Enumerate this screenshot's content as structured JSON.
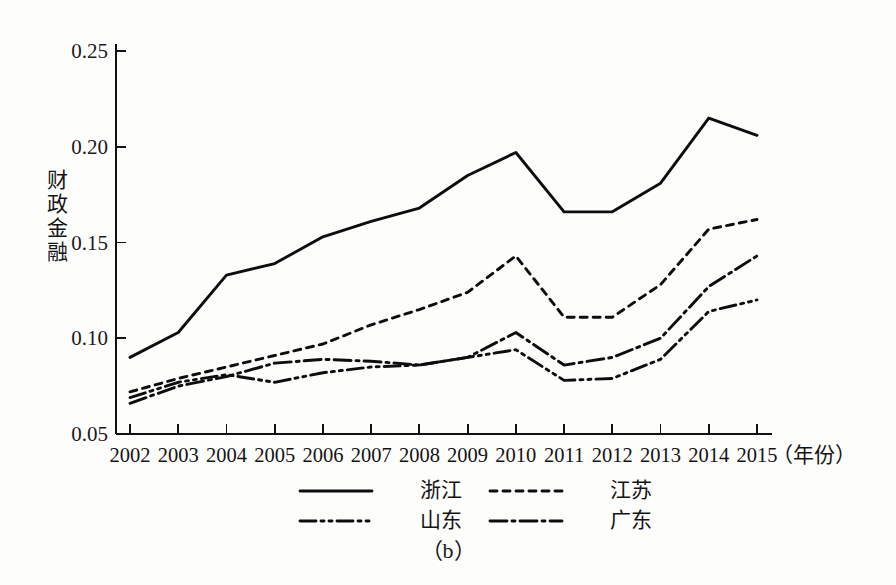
{
  "figure": {
    "caption": "（b）",
    "ylabel_chars": [
      "财",
      "政",
      "金",
      "融"
    ],
    "xlabel_suffix": "（年份）"
  },
  "chart_data": {
    "type": "line",
    "title": "",
    "xlabel": "（年份）",
    "ylabel": "财政金融",
    "categories": [
      "2002",
      "2003",
      "2004",
      "2005",
      "2006",
      "2007",
      "2008",
      "2009",
      "2010",
      "2011",
      "2012",
      "2013",
      "2014",
      "2015"
    ],
    "ylim": [
      0.05,
      0.25
    ],
    "yticks": [
      "0.05",
      "0.10",
      "0.15",
      "0.20",
      "0.25"
    ],
    "ytick_values": [
      0.05,
      0.1,
      0.15,
      0.2,
      0.25
    ],
    "grid": false,
    "legend_position": "bottom",
    "series": [
      {
        "name": "浙江",
        "style": "solid",
        "values": [
          0.09,
          0.103,
          0.133,
          0.139,
          0.153,
          0.161,
          0.168,
          0.185,
          0.197,
          0.166,
          0.166,
          0.181,
          0.215,
          0.206
        ]
      },
      {
        "name": "江苏",
        "style": "dotted",
        "values": [
          0.072,
          0.079,
          0.085,
          0.091,
          0.097,
          0.107,
          0.115,
          0.124,
          0.143,
          0.111,
          0.111,
          0.128,
          0.157,
          0.162
        ]
      },
      {
        "name": "山东",
        "style": "dash-dot-dot",
        "values": [
          0.069,
          0.077,
          0.081,
          0.077,
          0.082,
          0.085,
          0.086,
          0.09,
          0.094,
          0.078,
          0.079,
          0.089,
          0.114,
          0.12
        ]
      },
      {
        "name": "广东",
        "style": "dash-dot",
        "values": [
          0.066,
          0.075,
          0.08,
          0.087,
          0.089,
          0.088,
          0.086,
          0.09,
          0.103,
          0.086,
          0.09,
          0.1,
          0.127,
          0.143
        ]
      }
    ]
  },
  "legend": {
    "entries": [
      {
        "label": "浙江",
        "style": "solid"
      },
      {
        "label": "江苏",
        "style": "dotted"
      },
      {
        "label": "山东",
        "style": "dash-dot-dot"
      },
      {
        "label": "广东",
        "style": "dash-dot"
      }
    ]
  },
  "colors": {
    "ink": "#0d0d0d",
    "background": "#fdfdfc"
  }
}
